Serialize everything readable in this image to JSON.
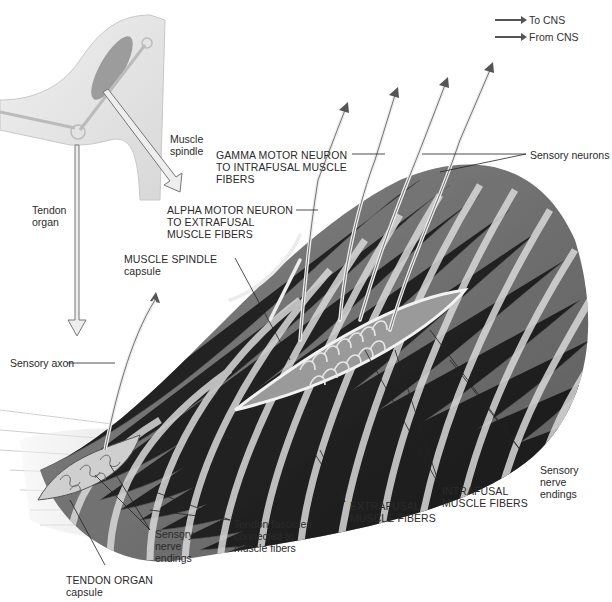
{
  "legend": {
    "to_cns": "To CNS",
    "from_cns": "From CNS"
  },
  "labels": {
    "muscle_spindle_top": [
      "Muscle",
      "spindle"
    ],
    "tendon_organ_top": [
      "Tendon",
      "organ"
    ],
    "gamma_motor": [
      "GAMMA MOTOR NEURON",
      "TO INTRAFUSAL MUSCLE",
      "FIBERS"
    ],
    "alpha_motor": [
      "ALPHA MOTOR NEURON",
      "TO EXTRAFUSAL",
      "MUSCLE FIBERS"
    ],
    "sensory_neurons": "Sensory neurons",
    "muscle_spindle_capsule": [
      "MUSCLE SPINDLE",
      "capsule"
    ],
    "sensory_axon": "Sensory axon",
    "sensory_nerve_endings_right": [
      "Sensory",
      "nerve",
      "endings"
    ],
    "intrafusal": [
      "INTRAFUSAL",
      "MUSCLE FIBERS"
    ],
    "extrafusal": [
      "EXTRAFUSAL",
      "MUSCLE FIBERS"
    ],
    "tendon_fascicles": [
      "Tendon fascicles",
      "connected to",
      "muscle fibers"
    ],
    "sensory_nerve_endings_left": [
      "Sensory",
      "nerve",
      "endings"
    ],
    "tendon_organ_capsule": [
      "TENDON ORGAN",
      "capsule"
    ]
  },
  "colors": {
    "muscle_dark": "#6a6a6a",
    "muscle_mid": "#8c8c8c",
    "stripe": "#d6d6d6",
    "nerve": "#e8e8e8",
    "leader": "#222222"
  }
}
